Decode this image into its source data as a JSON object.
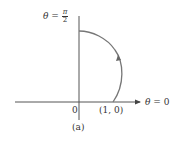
{
  "diagram": {
    "top_label": {
      "theta": "θ",
      "equals": "=",
      "numerator": "π",
      "denominator": "2"
    },
    "right_label": {
      "theta": "θ",
      "equals": "=",
      "value": "0"
    },
    "origin_label": "0",
    "point_label": "(1, 0)",
    "caption": "(a)",
    "colors": {
      "axis": "#555555",
      "curve": "#777777",
      "text": "#333333"
    }
  }
}
